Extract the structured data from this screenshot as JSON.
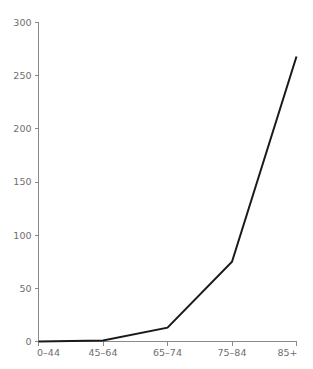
{
  "chart_data": {
    "type": "line",
    "title": "",
    "subtitle": "",
    "xlabel": "",
    "ylabel": "",
    "categories": [
      "0–44",
      "45–64",
      "65–74",
      "75–84",
      "85+"
    ],
    "series": [
      {
        "name": "",
        "values": [
          0,
          1,
          13,
          75,
          268
        ]
      }
    ],
    "ylim": [
      0,
      300
    ],
    "yticks": [
      0,
      50,
      100,
      150,
      200,
      250,
      300
    ],
    "ytick_labels": [
      "0",
      "50",
      "100",
      "150",
      "200",
      "250",
      "300"
    ],
    "xtick_labels": [
      "0–44",
      "45–64",
      "65–74",
      "75–84",
      "85+"
    ],
    "grid": false,
    "legend": false,
    "legend_position": "none",
    "annotations": [],
    "colors": {
      "line": "#1a1a1a",
      "axis": "#8a8a8a",
      "tick_text": "#6e6e6e",
      "background": "#ffffff"
    }
  }
}
